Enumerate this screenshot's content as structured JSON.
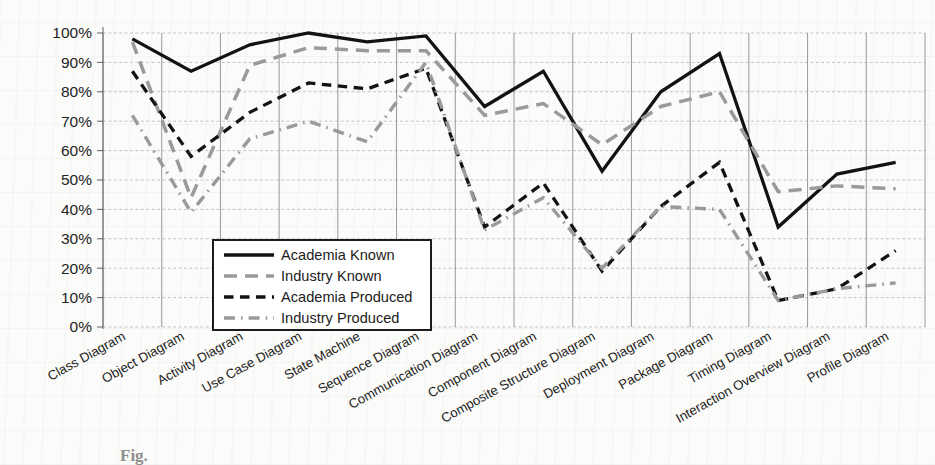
{
  "figure": {
    "caption_partial": "Fig."
  },
  "chart_data": {
    "type": "line",
    "title": "",
    "xlabel": "",
    "ylabel": "",
    "ylim": [
      0,
      100
    ],
    "ytick_values": [
      0,
      10,
      20,
      30,
      40,
      50,
      60,
      70,
      80,
      90,
      100
    ],
    "ytick_labels": [
      "0%",
      "10%",
      "20%",
      "30%",
      "40%",
      "50%",
      "60%",
      "70%",
      "80%",
      "90%",
      "100%"
    ],
    "grid": true,
    "grid_axis": "both",
    "legend_position": "lower-center-left",
    "categories": [
      "Class Diagram",
      "Object Diagram",
      "Activity Diagram",
      "Use Case Diagram",
      "State Machine",
      "Sequence Diagram",
      "Communication Diagram",
      "Component Diagram",
      "Composite Structure Diagram",
      "Deployment Diagram",
      "Package Diagram",
      "Timing Diagram",
      "Interaction Overview Diagram",
      "Profile Diagram"
    ],
    "series": [
      {
        "name": "Academia Known",
        "style": "solid",
        "color": "#131313",
        "values": [
          98,
          87,
          96,
          100,
          97,
          99,
          75,
          87,
          53,
          80,
          93,
          34,
          52,
          56
        ]
      },
      {
        "name": "Industry Known",
        "style": "dashed",
        "color": "#9a9a9a",
        "values": [
          97,
          44,
          89,
          95,
          94,
          94,
          72,
          76,
          62,
          75,
          80,
          46,
          48,
          47
        ]
      },
      {
        "name": "Academia Produced",
        "style": "dashed-bold",
        "color": "#131313",
        "values": [
          87,
          58,
          73,
          83,
          81,
          88,
          34,
          49,
          19,
          41,
          56,
          9,
          13,
          26
        ]
      },
      {
        "name": "Industry Produced",
        "style": "dash-dot",
        "color": "#9a9a9a",
        "values": [
          72,
          39,
          64,
          70,
          63,
          90,
          33,
          44,
          20,
          41,
          40,
          9,
          13,
          15
        ]
      }
    ]
  },
  "legend": {
    "items": [
      {
        "label": "Academia Known",
        "key_class": "lk-academia-known"
      },
      {
        "label": "Industry Known",
        "key_class": "lk-industry-known"
      },
      {
        "label": "Academia Produced",
        "key_class": "lk-academia-produced"
      },
      {
        "label": "Industry Produced",
        "key_class": "lk-industry-produced"
      }
    ]
  }
}
